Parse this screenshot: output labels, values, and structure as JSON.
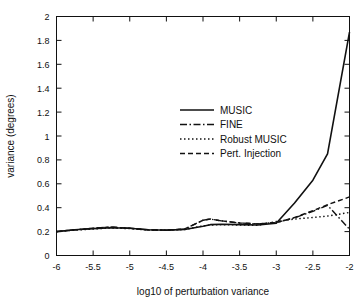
{
  "chart_data": {
    "type": "line",
    "title": "",
    "xlabel": "log10 of perturbation variance",
    "ylabel": "variance (degrees)",
    "xlim": [
      -6,
      -2
    ],
    "ylim": [
      0,
      2
    ],
    "xticks": [
      -6,
      -5.5,
      -5,
      -4.5,
      -4,
      -3.5,
      -3,
      -2.5,
      -2
    ],
    "xtick_labels": [
      "-6",
      "-5.5",
      "-5",
      "-4.5",
      "-4",
      "-3.5",
      "-3",
      "-2.5",
      "-2"
    ],
    "yticks": [
      0,
      0.2,
      0.4,
      0.6,
      0.8,
      1,
      1.2,
      1.4,
      1.6,
      1.8,
      2
    ],
    "ytick_labels": [
      "0",
      "0.2",
      "0.4",
      "0.6",
      "0.8",
      "1",
      "1.2",
      "1.4",
      "1.6",
      "1.8",
      "2"
    ],
    "grid": false,
    "legend_position": "center",
    "line_color": "#111111",
    "x": [
      -6,
      -5.75,
      -5.5,
      -5.25,
      -5,
      -4.75,
      -4.5,
      -4.25,
      -4,
      -3.9,
      -3.75,
      -3.5,
      -3.25,
      -3,
      -2.75,
      -2.5,
      -2.3,
      -2
    ],
    "series": [
      {
        "name": "MUSIC",
        "style": "solid",
        "dasharray": "",
        "width": 1.6,
        "values": [
          0.2,
          0.215,
          0.225,
          0.232,
          0.228,
          0.215,
          0.212,
          0.218,
          0.245,
          0.258,
          0.262,
          0.258,
          0.255,
          0.27,
          0.44,
          0.63,
          0.85,
          1.87
        ]
      },
      {
        "name": "FINE",
        "style": "dash-dot",
        "dasharray": "7,2.5,1.5,2.5",
        "width": 1.4,
        "values": [
          0.2,
          0.215,
          0.228,
          0.238,
          0.228,
          0.215,
          0.212,
          0.222,
          0.295,
          0.305,
          0.29,
          0.272,
          0.265,
          0.275,
          0.315,
          0.37,
          0.42,
          0.22
        ]
      },
      {
        "name": "Robust MUSIC",
        "style": "dotted",
        "dasharray": "1.5,2.5",
        "width": 1.4,
        "values": [
          0.2,
          0.212,
          0.222,
          0.23,
          0.225,
          0.212,
          0.21,
          0.218,
          0.248,
          0.255,
          0.258,
          0.255,
          0.252,
          0.285,
          0.305,
          0.318,
          0.33,
          0.36
        ]
      },
      {
        "name": "Pert. Injection",
        "style": "dashed",
        "dasharray": "5,3",
        "width": 1.4,
        "values": [
          0.2,
          0.215,
          0.228,
          0.238,
          0.228,
          0.215,
          0.212,
          0.222,
          0.295,
          0.305,
          0.29,
          0.272,
          0.265,
          0.275,
          0.318,
          0.375,
          0.425,
          0.49
        ]
      }
    ],
    "legend": [
      {
        "label": "MUSIC",
        "style": "solid"
      },
      {
        "label": "FINE",
        "style": "dash-dot"
      },
      {
        "label": "Robust MUSIC",
        "style": "dotted"
      },
      {
        "label": "Pert. Injection",
        "style": "dashed"
      }
    ]
  }
}
